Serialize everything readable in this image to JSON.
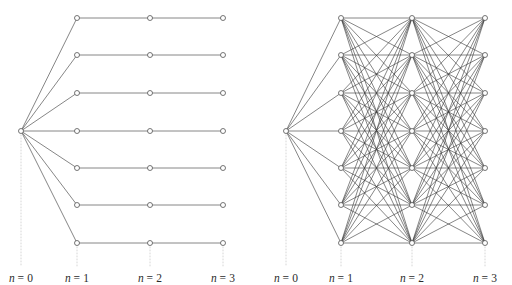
{
  "figure": {
    "type": "graph-diagram",
    "background_color": "#ffffff",
    "width": 512,
    "height": 285,
    "edge_color": "#3a3a3a",
    "node_stroke_color": "#4a4a4a",
    "node_fill_color": "#ffffff",
    "guide_color": "#cccccc",
    "label_color": "#2b2b2b",
    "top_fragment_text": "n"
  },
  "columns": {
    "labels": [
      "n = 0",
      "n = 1",
      "n = 2",
      "n = 3"
    ],
    "label_parts": [
      {
        "var": "n",
        "eq": "= 0"
      },
      {
        "var": "n",
        "eq": "= 1"
      },
      {
        "var": "n",
        "eq": "= 2"
      },
      {
        "var": "n",
        "eq": "= 3"
      }
    ],
    "label_y": 272,
    "node_counts": [
      1,
      7,
      7,
      7
    ]
  },
  "panels": [
    {
      "id": "left",
      "name": "sparse-chain-graph",
      "description": "single root fans out to seven nodes, each continuing as an independent horizontal chain",
      "column_x": [
        21,
        77,
        150,
        223
      ],
      "row_y": [
        18,
        55,
        93,
        131,
        168,
        205,
        243
      ],
      "root_y": 131,
      "edges_stage1": "complete: root to all seven n=1 nodes",
      "edges_stage2": "matching: n=1 row i to n=2 row i",
      "edges_stage3": "matching: n=2 row i to n=3 row i",
      "edge_count": 21
    },
    {
      "id": "right",
      "name": "complete-layered-graph",
      "description": "single root fans out to seven nodes, then every node connects to every node in the next column",
      "column_x": [
        286,
        341,
        412,
        485
      ],
      "row_y": [
        18,
        55,
        93,
        131,
        168,
        205,
        243
      ],
      "root_y": 131,
      "edges_stage1": "complete: root to all seven n=1 nodes",
      "edges_stage2": "complete bipartite: all n=1 to all n=2",
      "edges_stage3": "complete bipartite: all n=2 to all n=3",
      "edge_count": 105
    }
  ],
  "chart_data": {
    "type": "diagram",
    "title": "",
    "xlabel": "",
    "ylabel": "",
    "stages": [
      "n = 0",
      "n = 1",
      "n = 2",
      "n = 3"
    ],
    "nodes_per_stage": [
      1,
      7,
      7,
      7
    ],
    "left_graph_edges_per_transition": [
      7,
      7,
      7
    ],
    "right_graph_edges_per_transition": [
      7,
      49,
      49
    ]
  }
}
